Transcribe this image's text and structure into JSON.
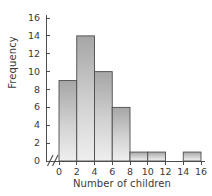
{
  "chart_data": {
    "type": "bar",
    "title": "",
    "subtitle": "",
    "xlabel": "Number of children",
    "ylabel": "Frequency",
    "bin_edges": [
      0,
      2,
      4,
      6,
      8,
      10,
      12,
      14,
      16
    ],
    "categories": [
      "0-2",
      "2-4",
      "4-6",
      "6-8",
      "8-10",
      "10-12",
      "12-14",
      "14-16"
    ],
    "values": [
      9,
      14,
      10,
      6,
      1,
      1,
      0,
      1
    ],
    "xlim": [
      0,
      16
    ],
    "ylim": [
      0,
      16
    ],
    "x_ticks": [
      "0",
      "2",
      "4",
      "6",
      "8",
      "10",
      "12",
      "14",
      "16"
    ],
    "y_ticks": [
      "0",
      "2",
      "4",
      "6",
      "8",
      "10",
      "12",
      "14",
      "16"
    ],
    "grid": false,
    "legend": "none",
    "axis_break": "//",
    "bar_fill_top": "#a6a6a6",
    "bar_fill_bottom": "#eeeeee",
    "bar_edge": "#4d4d4d",
    "axis_color": "#4d4d4d",
    "text_color": "#3a3a3a",
    "background": "#ffffff"
  },
  "axes": {
    "x_title": "Number of children",
    "y_title": "Frequency"
  }
}
